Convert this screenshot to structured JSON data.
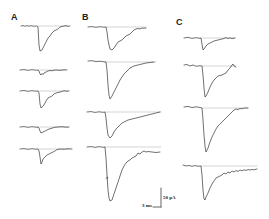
{
  "figure": {
    "panels": [
      {
        "label": "A",
        "trace_count": 5
      },
      {
        "label": "B",
        "trace_count": 4
      },
      {
        "label": "C",
        "trace_count": 4
      }
    ],
    "scale_bar": {
      "time_label": "3 ms",
      "current_label": "50 pA"
    }
  },
  "colors": {
    "trace": "#333333",
    "baseline": "#999999",
    "background": "#ffffff"
  }
}
